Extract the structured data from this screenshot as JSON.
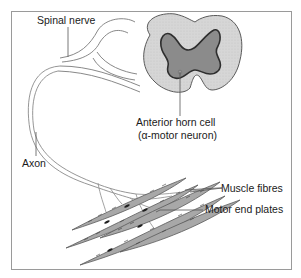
{
  "figure": {
    "labels": {
      "spinal_nerve": "Spinal nerve",
      "anterior_horn_cell_line1": "Anterior horn cell",
      "anterior_horn_cell_line2": "(α-motor neuron)",
      "axon": "Axon",
      "muscle_fibres": "Muscle fibres",
      "motor_end_plates": "Motor end plates"
    },
    "colors": {
      "white_matter": "#d4d4d4",
      "grey_matter": "#8c8c8c",
      "muscle_fibre": "#a9a9a9",
      "nerve_line": "#8a8a8a",
      "outline": "#555555",
      "end_plate": "#1f1f1f"
    }
  }
}
